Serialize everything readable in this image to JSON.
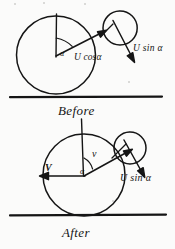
{
  "document": {
    "title": "Before and After collision velocity diagram",
    "medium": "hand-drawn pen sketch, scanned",
    "ink_color": "#151515",
    "paper_color": "#fbfbfa"
  },
  "diagrams": [
    {
      "id": "before",
      "caption": "Before",
      "big_circle": {
        "cx": 56,
        "cy": 55,
        "r": 39
      },
      "small_circle": {
        "cx": 120,
        "cy": 28,
        "r": 17
      },
      "ground_line": {
        "x1": 10,
        "y1": 97,
        "x2": 162,
        "y2": 97
      },
      "labels": [
        {
          "name": "u-cos-alpha",
          "text": "U cosα"
        },
        {
          "name": "u-sin-alpha",
          "text": "U sin α"
        },
        {
          "name": "angle-alpha",
          "text": "α"
        }
      ]
    },
    {
      "id": "after",
      "caption": "After",
      "big_circle": {
        "cx": 84,
        "cy": 175,
        "r": 41
      },
      "small_circle": {
        "cx": 130,
        "cy": 148,
        "r": 16
      },
      "ground_line": {
        "x1": 10,
        "y1": 215,
        "x2": 165,
        "y2": 215
      },
      "labels": [
        {
          "name": "velocity-V",
          "text": "V"
        },
        {
          "name": "velocity-v",
          "text": "v"
        },
        {
          "name": "u-sin-alpha",
          "text": "U sin α"
        },
        {
          "name": "angle-alpha",
          "text": "α"
        }
      ]
    }
  ],
  "labels": {
    "u_cos_alpha": "U cosα",
    "u_sin_alpha_top": "U sin α",
    "u_sin_alpha_bottom": "U sin α",
    "alpha_top": "α",
    "alpha_bottom": "α",
    "velocity_V": "V",
    "velocity_v": "v",
    "caption_before": "Before",
    "caption_after": "After"
  }
}
